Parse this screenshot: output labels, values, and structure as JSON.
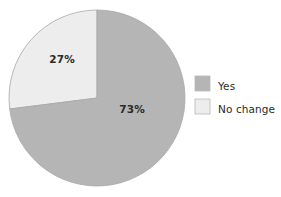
{
  "figure": {
    "background_color": "#ffffff",
    "width": 281,
    "height": 197
  },
  "chart_data": {
    "type": "pie",
    "title": "",
    "subtitle": "",
    "xlabel": "",
    "ylabel": "",
    "grid": false,
    "legend_position": "right",
    "start_angle_deg": 0,
    "center": {
      "x": 97,
      "y": 98
    },
    "radius": 88,
    "labels": [
      "Yes",
      "No change"
    ],
    "values": [
      73,
      27
    ],
    "value_suffix": "%",
    "colors": [
      "#b5b5b5",
      "#ededed"
    ],
    "edge_color": "#a8a8a8",
    "slices": [
      {
        "label": "Yes",
        "value": 73,
        "display_value": "73%",
        "color": "#b5b5b5",
        "direction": "clockwise-from-top",
        "sweep_deg": 262.8,
        "label_x": 132,
        "label_y": 110
      },
      {
        "label": "No change",
        "value": 27,
        "display_value": "27%",
        "color": "#ededed",
        "direction": "counterclockwise-from-top",
        "sweep_deg": 97.2,
        "label_x": 62,
        "label_y": 60
      }
    ]
  },
  "legend": {
    "entries": [
      {
        "label": "Yes",
        "color": "#b5b5b5",
        "swatch_x": 195,
        "swatch_y": 76,
        "text_x": 218,
        "text_y": 87
      },
      {
        "label": "No change",
        "color": "#ededed",
        "swatch_x": 195,
        "swatch_y": 99,
        "text_x": 218,
        "text_y": 110
      }
    ],
    "swatch_size": 15,
    "swatch_edge_color": "#b9b9b9"
  }
}
